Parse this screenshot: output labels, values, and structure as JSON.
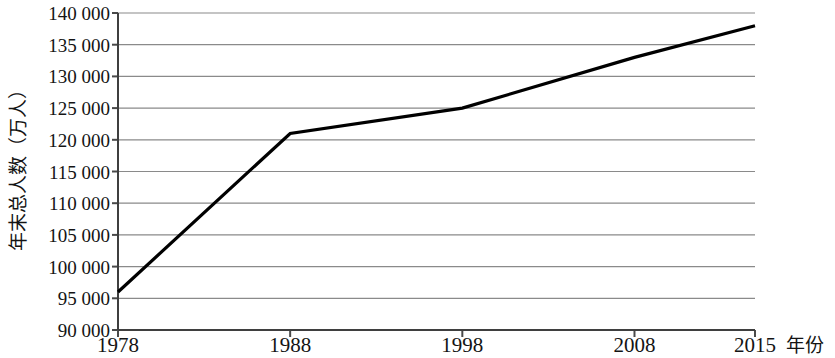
{
  "chart_data": {
    "type": "line",
    "title": "",
    "subtitle": "",
    "xlabel": "年份",
    "ylabel": "年末总人数（万人）",
    "x": [
      1978,
      1988,
      1998,
      2008,
      2015
    ],
    "xtick_labels": [
      "1978",
      "1988",
      "1998",
      "2008",
      "2015"
    ],
    "values": [
      96000,
      121000,
      125000,
      133000,
      138000
    ],
    "ytick_labels": [
      "140 000",
      "135 000",
      "130 000",
      "125 000",
      "120 000",
      "115 000",
      "110 000",
      "105 000",
      "100 000",
      "95 000",
      "90 000"
    ],
    "ytick_values": [
      140000,
      135000,
      130000,
      125000,
      120000,
      115000,
      110000,
      105000,
      100000,
      95000,
      90000
    ],
    "ylim": [
      90000,
      140000
    ],
    "xlim": [
      1978,
      2015
    ],
    "grid": true,
    "legend": false,
    "series": [
      {
        "name": "年末总人数",
        "color": "#000000",
        "values": [
          96000,
          121000,
          125000,
          133000,
          138000
        ]
      }
    ],
    "colors": {
      "line": "#0d0d0d",
      "grid": "#8a8a8a",
      "axis": "#4a4a4a",
      "text": "#141414",
      "background": "#ffffff"
    }
  }
}
